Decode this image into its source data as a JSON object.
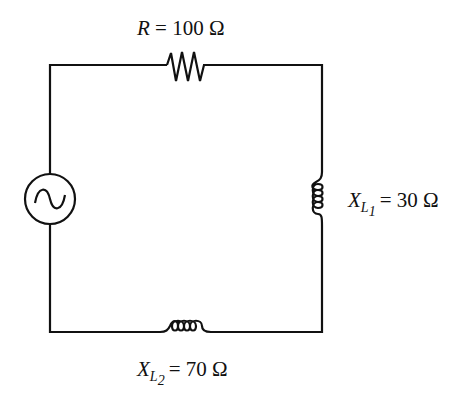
{
  "diagram": {
    "type": "series AC circuit",
    "source": {
      "name": "AC voltage source",
      "symbol": "sine-wave"
    },
    "components": [
      {
        "id": "resistor",
        "symbol_letter": "R",
        "equals": "=",
        "value": "100",
        "unit": "Ω",
        "position": "top"
      },
      {
        "id": "inductor-1",
        "symbol_letter": "X",
        "subscript_main": "L",
        "subscript_index": "1",
        "equals": "=",
        "value": "30",
        "unit": "Ω",
        "position": "right"
      },
      {
        "id": "inductor-2",
        "symbol_letter": "X",
        "subscript_main": "L",
        "subscript_index": "2",
        "equals": "=",
        "value": "70",
        "unit": "Ω",
        "position": "bottom"
      }
    ],
    "colors": {
      "line": "#111111",
      "background": "#ffffff"
    }
  }
}
